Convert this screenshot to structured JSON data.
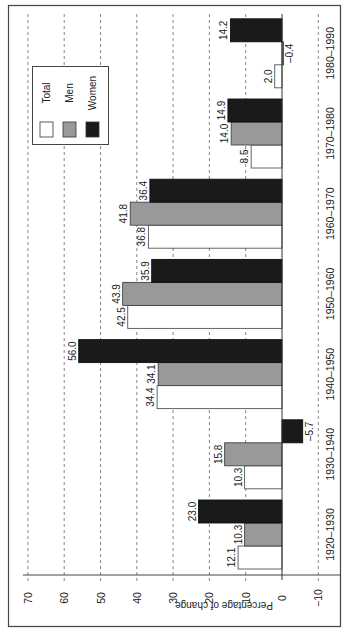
{
  "chart_data": {
    "type": "bar",
    "orientation": "vertical bars, figure rotated 90° counter-clockwise",
    "title": "",
    "xlabel": "",
    "ylabel": "Percentage of change",
    "ylim": [
      -10,
      70
    ],
    "yticks": [
      -10,
      0,
      10,
      20,
      30,
      40,
      50,
      60,
      70
    ],
    "ytick_labels": [
      "−10",
      "0",
      "10",
      "20",
      "30",
      "40",
      "50",
      "60",
      "70"
    ],
    "grid": "dashed lines at each y tick",
    "categories": [
      "1920–1930",
      "1930–1940",
      "1940–1950",
      "1950–1960",
      "1960–1970",
      "1970–1980",
      "1980–1990"
    ],
    "series": [
      {
        "name": "Total",
        "color": "#ffffff",
        "values": [
          12.1,
          10.3,
          34.4,
          42.5,
          36.8,
          8.5,
          2.0
        ],
        "labels": [
          "12.1",
          "10.3",
          "34.4",
          "42.5",
          "36.8",
          "8.5",
          "2.0"
        ]
      },
      {
        "name": "Men",
        "color": "#999999",
        "values": [
          10.3,
          15.8,
          34.1,
          43.9,
          41.8,
          14.0,
          -0.4
        ],
        "labels": [
          "10.3",
          "15.8",
          "34.1",
          "43.9",
          "41.8",
          "14.0",
          "–0.4"
        ]
      },
      {
        "name": "Women",
        "color": "#1a1a1a",
        "values": [
          23.0,
          -5.7,
          56.0,
          35.9,
          36.4,
          14.9,
          14.2
        ],
        "labels": [
          "23.0",
          "–5.7",
          "56.0",
          "35.9",
          "36.4",
          "14.9",
          "14.2"
        ]
      }
    ],
    "legend": {
      "position": "top-left (upper-right in unrotated view)",
      "entries": [
        "Total",
        "Men",
        "Women"
      ]
    }
  }
}
